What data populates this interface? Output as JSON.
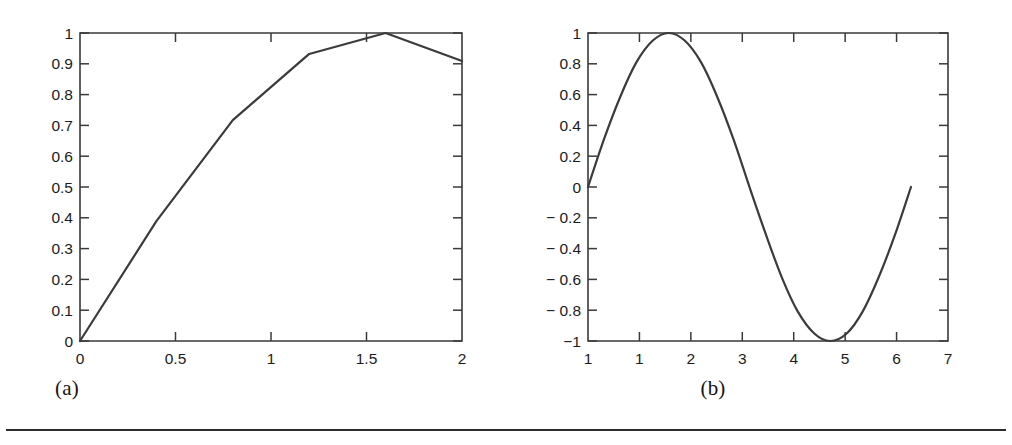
{
  "figure": {
    "rule_visible": true,
    "panels": [
      {
        "id": "a",
        "caption": "(a)"
      },
      {
        "id": "b",
        "caption": "(b)"
      }
    ]
  },
  "chart_data": [
    {
      "type": "line",
      "panel": "a",
      "title": "",
      "subtitle": "",
      "xlabel": "",
      "ylabel": "",
      "xlim": [
        0,
        2
      ],
      "ylim": [
        0,
        1
      ],
      "grid": false,
      "legend": null,
      "annotations": [],
      "x_ticks": [
        0,
        0.5,
        1,
        1.5,
        2
      ],
      "x_tick_labels": [
        "0",
        "0.5",
        "1",
        "1.5",
        "2"
      ],
      "y_ticks": [
        0,
        0.1,
        0.2,
        0.3,
        0.4,
        0.5,
        0.6,
        0.7,
        0.8,
        0.9,
        1
      ],
      "y_tick_labels": [
        "0",
        "0.1",
        "0.2",
        "0.3",
        "0.4",
        "0.5",
        "0.6",
        "0.7",
        "0.8",
        "0.9",
        "1"
      ],
      "line_style": "piecewise-linear",
      "series": [
        {
          "name": "sin(x) coarse sampling",
          "x": [
            0,
            0.4,
            0.8,
            1.2,
            1.6,
            2.0
          ],
          "values": [
            0,
            0.389,
            0.717,
            0.932,
            1.0,
            0.909
          ],
          "color": "#3b3b3b"
        }
      ]
    },
    {
      "type": "line",
      "panel": "b",
      "title": "",
      "subtitle": "",
      "xlabel": "",
      "ylabel": "",
      "xlim": [
        0,
        7
      ],
      "ylim": [
        -1,
        1
      ],
      "grid": false,
      "legend": null,
      "annotations": [],
      "x_ticks": [
        0,
        1,
        2,
        3,
        4,
        5,
        6,
        7
      ],
      "x_tick_labels": [
        "1",
        "1",
        "2",
        "3",
        "4",
        "5",
        "6",
        "7"
      ],
      "y_ticks": [
        1,
        0.8,
        0.6,
        0.4,
        0.2,
        0,
        -0.2,
        -0.4,
        -0.6,
        -0.8,
        -1
      ],
      "y_tick_labels": [
        "1",
        "0.8",
        "0.6",
        "0.4",
        "0.2",
        "0",
        "− 0.2",
        "− 0.4",
        "− 0.6",
        "− 0.8",
        "−1"
      ],
      "line_style": "smooth",
      "series": [
        {
          "name": "sin(x) fine sampling",
          "x": [
            0,
            0.31,
            0.63,
            0.94,
            1.26,
            1.57,
            1.88,
            2.2,
            2.51,
            2.83,
            3.14,
            3.46,
            3.77,
            4.08,
            4.4,
            4.71,
            5.03,
            5.34,
            5.65,
            5.97,
            6.28
          ],
          "values": [
            0,
            0.309,
            0.588,
            0.809,
            0.951,
            1.0,
            0.951,
            0.809,
            0.588,
            0.309,
            0,
            -0.309,
            -0.588,
            -0.809,
            -0.951,
            -1.0,
            -0.951,
            -0.809,
            -0.588,
            -0.309,
            0
          ],
          "color": "#3b3b3b"
        }
      ]
    }
  ]
}
